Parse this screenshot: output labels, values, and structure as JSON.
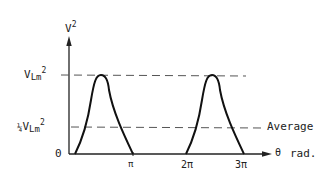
{
  "diagram": {
    "y_axis": {
      "symbol": "V",
      "exponent": "2"
    },
    "x_axis": {
      "symbol": "θ",
      "unit": "rad."
    },
    "levels": [
      {
        "id": "peak",
        "prefix": "",
        "symbol": "V",
        "subscript": "Lm",
        "exponent": "2"
      },
      {
        "id": "average",
        "prefix": "¼",
        "symbol": "V",
        "subscript": "Lm",
        "exponent": "2",
        "annotation": "Average"
      }
    ],
    "x_ticks": [
      "0",
      "π",
      "2π",
      "3π"
    ],
    "colors": {
      "curve": "#111111",
      "dashes": "#555555",
      "axes": "#222222"
    }
  }
}
